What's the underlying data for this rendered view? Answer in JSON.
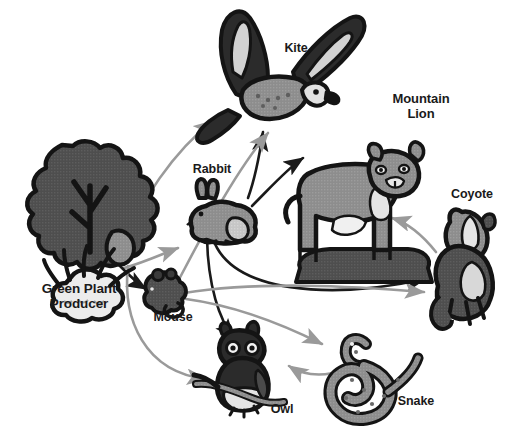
{
  "diagram": {
    "background_color": "#ffffff",
    "width": 507,
    "height": 442
  },
  "colors": {
    "arrow_dark": "#1a1a1a",
    "arrow_light": "#9a9a9a",
    "label_text": "#1a1a1a",
    "organism_outline": "#141414",
    "organism_dark_fill": "#4a4a4a",
    "organism_mid_fill": "#8a8a8a",
    "organism_light_fill": "#cccccc",
    "organism_pale_fill": "#e8e8e8"
  },
  "organisms": [
    {
      "id": "green-plant",
      "label": "Green Plant\nProducer",
      "role": "producer",
      "icon": "tree-and-grass-icon"
    },
    {
      "id": "mouse",
      "label": "Mouse",
      "role": "primary-consumer",
      "icon": "mouse-icon"
    },
    {
      "id": "rabbit",
      "label": "Rabbit",
      "role": "primary-consumer",
      "icon": "rabbit-icon"
    },
    {
      "id": "kite",
      "label": "Kite",
      "role": "secondary-consumer",
      "icon": "kite-bird-icon"
    },
    {
      "id": "mountain-lion",
      "label": "Mountain\nLion",
      "role": "tertiary-consumer",
      "icon": "mountain-lion-icon"
    },
    {
      "id": "coyote",
      "label": "Coyote",
      "role": "secondary-consumer",
      "icon": "coyote-icon"
    },
    {
      "id": "snake",
      "label": "Snake",
      "role": "secondary-consumer",
      "icon": "snake-icon"
    },
    {
      "id": "owl",
      "label": "Owl",
      "role": "secondary-consumer",
      "icon": "owl-icon"
    }
  ],
  "links": [
    {
      "from": "green-plant",
      "to": "mouse",
      "style": "dark"
    },
    {
      "from": "green-plant",
      "to": "rabbit",
      "style": "light"
    },
    {
      "from": "green-plant",
      "to": "kite",
      "style": "light"
    },
    {
      "from": "green-plant",
      "to": "owl",
      "style": "light"
    },
    {
      "from": "rabbit",
      "to": "kite",
      "style": "dark"
    },
    {
      "from": "rabbit",
      "to": "mountain-lion",
      "style": "dark"
    },
    {
      "from": "rabbit",
      "to": "coyote",
      "style": "dark"
    },
    {
      "from": "rabbit",
      "to": "owl",
      "style": "dark"
    },
    {
      "from": "mouse",
      "to": "kite",
      "style": "light"
    },
    {
      "from": "mouse",
      "to": "coyote",
      "style": "light"
    },
    {
      "from": "mouse",
      "to": "snake",
      "style": "light"
    },
    {
      "from": "coyote",
      "to": "mountain-lion",
      "style": "light"
    },
    {
      "from": "snake",
      "to": "owl",
      "style": "light"
    }
  ]
}
